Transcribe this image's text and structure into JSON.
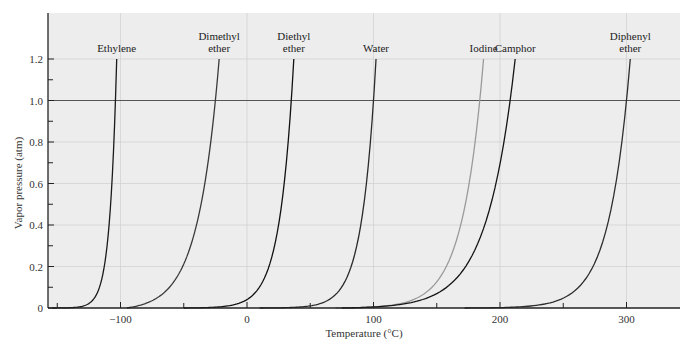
{
  "chart_data": {
    "type": "line",
    "title": "",
    "xlabel": "Temperature (°C)",
    "ylabel": "Vapor pressure (atm)",
    "xlim": [
      -157,
      342
    ],
    "ylim": [
      0,
      1.35
    ],
    "x_ticks_major": [
      -100,
      0,
      100,
      200,
      300
    ],
    "x_tick_labels": [
      "−100",
      "0",
      "100",
      "200",
      "300"
    ],
    "x_ticks_minor": [
      -150,
      -50,
      50,
      150,
      250
    ],
    "y_ticks_major": [
      0,
      0.2,
      0.4,
      0.6,
      0.8,
      1.0,
      1.2
    ],
    "y_tick_labels": [
      "0",
      "0.2",
      "0.4",
      "0.6",
      "0.8",
      "1.0",
      "1.2"
    ],
    "y_ticks_minor": [
      0.1,
      0.3,
      0.5,
      0.7,
      0.9,
      1.1
    ],
    "grid": true,
    "reference_line": {
      "y": 1.0,
      "label": ""
    },
    "legend": "inline labels at top of curves",
    "series": [
      {
        "name": "Ethylene",
        "label_lines": [
          "Ethylene"
        ],
        "color": "#1a1a1a",
        "t_start": -154,
        "t_bp": -104,
        "t_end": -103
      },
      {
        "name": "Dimethyl ether",
        "label_lines": [
          "Dimethyl",
          "ether"
        ],
        "color": "#3a3a3a",
        "t_start": -95,
        "t_bp": -25,
        "t_end": -22
      },
      {
        "name": "Diethyl ether",
        "label_lines": [
          "Diethyl",
          "ether"
        ],
        "color": "#111111",
        "t_start": -50,
        "t_bp": 35,
        "t_end": 37
      },
      {
        "name": "Water",
        "label_lines": [
          "Water"
        ],
        "color": "#2a2a2a",
        "t_start": 10,
        "t_bp": 100,
        "t_end": 102
      },
      {
        "name": "Iodine",
        "label_lines": [
          "Iodine"
        ],
        "color": "#9a9a9a",
        "t_start": 70,
        "t_bp": 184,
        "t_end": 187
      },
      {
        "name": "Camphor",
        "label_lines": [
          "Camphor"
        ],
        "color": "#151515",
        "t_start": 75,
        "t_bp": 208,
        "t_end": 212
      },
      {
        "name": "Diphenyl ether",
        "label_lines": [
          "Diphenyl",
          "ether"
        ],
        "color": "#2e2e2e",
        "t_start": 172,
        "t_bp": 300,
        "t_end": 303
      }
    ]
  },
  "colors": {
    "plot_background": "#ededed",
    "gridline": "#d2d2d2",
    "axis": "#222222",
    "reference_line": "#555555"
  }
}
